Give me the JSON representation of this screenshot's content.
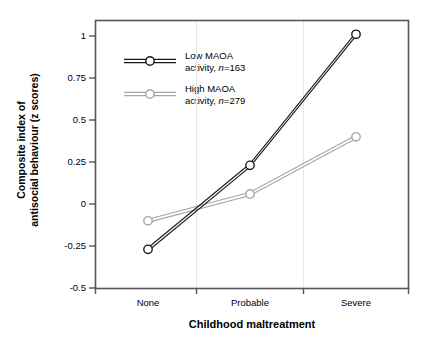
{
  "chart_data": {
    "type": "line",
    "title": "",
    "xlabel": "Childhood maltreatment",
    "ylabel": "Composite index of antisocial behaviour (z scores)",
    "ylabel_line1": "Composite index of",
    "ylabel_line2": "antisocial behaviour (z scores)",
    "categories": [
      "None",
      "Probable",
      "Severe"
    ],
    "ylim": [
      -0.5,
      1.0
    ],
    "yticks": [
      1,
      0.75,
      0.5,
      0.25,
      0,
      -0.25,
      -0.5
    ],
    "ytick_labels": [
      "1",
      "0.75",
      "0.5",
      "0.25",
      "0",
      "-0.25",
      "-0.5"
    ],
    "grid": "vertical-gridlines-at-category-boundaries",
    "legend_position": "upper-left-inside",
    "series": [
      {
        "name": "Low MAOA activity, n=163",
        "label_line1": "Low MAOA",
        "label_line2_pre": "activity, ",
        "label_line2_italic": "n",
        "label_line2_post": "=163",
        "color": "#1a1a1a",
        "values": [
          -0.27,
          0.23,
          1.01
        ]
      },
      {
        "name": "High MAOA activity, n=279",
        "label_line1": "High MAOA",
        "label_line2_pre": "activity, ",
        "label_line2_italic": "n",
        "label_line2_post": "=279",
        "color": "#a6a6a6",
        "values": [
          -0.1,
          0.06,
          0.4
        ]
      }
    ]
  },
  "axes": {
    "x_tick_labels": [
      "None",
      "Probable",
      "Severe"
    ],
    "y_tick_labels": [
      "1",
      "0.75",
      "0.5",
      "0.25",
      "0",
      "-0.25",
      "-0.5"
    ]
  },
  "colors": {
    "series_low": "#1a1a1a",
    "series_high": "#a6a6a6",
    "frame": "#4d4d4d",
    "gridline": "#e0e0e0",
    "background": "#ffffff"
  }
}
